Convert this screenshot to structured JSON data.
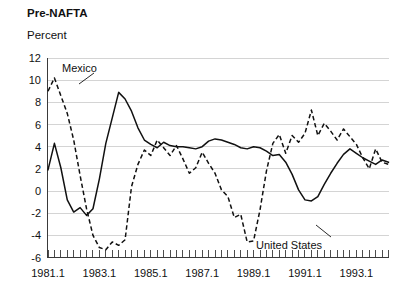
{
  "chart_data": {
    "type": "line",
    "title": "Pre-NAFTA",
    "subtitle": "Percent",
    "ylabel": "Percent",
    "xlabel": "",
    "ylim": [
      -6,
      12
    ],
    "yticks": [
      -6,
      -4,
      -2,
      0,
      2,
      4,
      6,
      8,
      10,
      12
    ],
    "ytick_labels": [
      "-6",
      "-4",
      "-2",
      "0",
      "2",
      "4",
      "6",
      "8",
      "10",
      "12"
    ],
    "grid": true,
    "legend_position": "inline-annotations",
    "x_start": "1981.1",
    "x_end": "1994.2",
    "x_interval": "quarterly",
    "xtick_labels": [
      "1981.1",
      "1983.1",
      "1985.1",
      "1987.1",
      "1989.1",
      "1991.1",
      "1993.1"
    ],
    "xtick_values": [
      1981.1,
      1983.1,
      1985.1,
      1987.1,
      1989.1,
      1991.1,
      1993.1
    ],
    "x": [
      "1981.1",
      "1981.2",
      "1981.3",
      "1981.4",
      "1982.1",
      "1982.2",
      "1982.3",
      "1982.4",
      "1983.1",
      "1983.2",
      "1983.3",
      "1983.4",
      "1984.1",
      "1984.2",
      "1984.3",
      "1984.4",
      "1985.1",
      "1985.2",
      "1985.3",
      "1985.4",
      "1986.1",
      "1986.2",
      "1986.3",
      "1986.4",
      "1987.1",
      "1987.2",
      "1987.3",
      "1987.4",
      "1988.1",
      "1988.2",
      "1988.3",
      "1988.4",
      "1989.1",
      "1989.2",
      "1989.3",
      "1989.4",
      "1990.1",
      "1990.2",
      "1990.3",
      "1990.4",
      "1991.1",
      "1991.2",
      "1991.3",
      "1991.4",
      "1992.1",
      "1992.2",
      "1992.3",
      "1992.4",
      "1993.1",
      "1993.2",
      "1993.3",
      "1993.4",
      "1994.1",
      "1994.2"
    ],
    "series": [
      {
        "name": "Mexico",
        "style": "dashed",
        "label_annotation": "Mexico",
        "values": [
          9.0,
          10.2,
          8.6,
          7.0,
          4.6,
          1.4,
          -1.6,
          -4.0,
          -5.1,
          -5.3,
          -4.6,
          -4.9,
          -4.4,
          0.4,
          2.4,
          3.7,
          3.2,
          4.6,
          3.9,
          3.2,
          4.1,
          2.9,
          1.6,
          2.1,
          3.5,
          2.5,
          1.6,
          0.1,
          -0.5,
          -2.4,
          -2.1,
          -4.6,
          -4.5,
          -1.7,
          1.8,
          4.3,
          5.1,
          3.4,
          5.0,
          4.4,
          5.2,
          7.3,
          5.0,
          6.1,
          5.4,
          4.6,
          5.6,
          4.9,
          4.2,
          3.0,
          2.0,
          3.8,
          2.6,
          2.4
        ]
      },
      {
        "name": "United States",
        "style": "solid",
        "label_annotation": "United States",
        "values": [
          1.9,
          4.3,
          2.1,
          -0.8,
          -1.9,
          -1.5,
          -2.2,
          -1.6,
          1.1,
          4.3,
          6.6,
          8.9,
          8.3,
          7.2,
          5.7,
          4.6,
          4.2,
          3.9,
          4.4,
          4.1,
          4.0,
          4.0,
          3.9,
          3.8,
          4.0,
          4.5,
          4.7,
          4.6,
          4.4,
          4.2,
          3.9,
          3.8,
          4.0,
          3.9,
          3.6,
          3.2,
          3.3,
          2.6,
          1.5,
          0.1,
          -0.8,
          -0.9,
          -0.5,
          0.6,
          1.6,
          2.5,
          3.3,
          3.8,
          3.4,
          3.0,
          2.7,
          2.4,
          2.8,
          2.6
        ]
      }
    ],
    "annotations": [
      {
        "text": "Mexico",
        "target_series": "Mexico"
      },
      {
        "text": "United States",
        "target_series": "United States"
      }
    ]
  }
}
